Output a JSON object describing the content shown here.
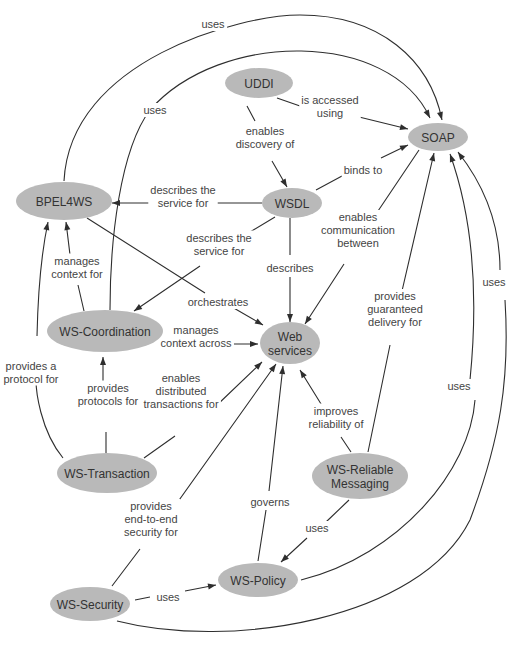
{
  "diagram": {
    "type": "concept-map",
    "style": {
      "node_fill": "#b9b9b9",
      "node_text": "#333333",
      "edge_color": "#2e2e2e",
      "label_color": "#444444",
      "background": "#ffffff"
    },
    "nodes": [
      {
        "id": "uddi",
        "label": [
          "UDDI"
        ],
        "cx": 259,
        "cy": 83,
        "rx": 34,
        "ry": 15
      },
      {
        "id": "soap",
        "label": [
          "SOAP"
        ],
        "cx": 438,
        "cy": 137,
        "rx": 30,
        "ry": 14
      },
      {
        "id": "wsdl",
        "label": [
          "WSDL"
        ],
        "cx": 292,
        "cy": 203,
        "rx": 30,
        "ry": 15
      },
      {
        "id": "bpel4ws",
        "label": [
          "BPEL4WS"
        ],
        "cx": 64,
        "cy": 201,
        "rx": 48,
        "ry": 19
      },
      {
        "id": "ws-coordination",
        "label": [
          "WS-Coordination"
        ],
        "cx": 105,
        "cy": 331,
        "rx": 58,
        "ry": 21
      },
      {
        "id": "web-services",
        "label": [
          "Web",
          "services"
        ],
        "cx": 290,
        "cy": 343,
        "rx": 30,
        "ry": 21
      },
      {
        "id": "ws-transaction",
        "label": [
          "WS-Transaction"
        ],
        "cx": 107,
        "cy": 473,
        "rx": 50,
        "ry": 20
      },
      {
        "id": "ws-reliable-messaging",
        "label": [
          "WS-Reliable",
          "Messaging"
        ],
        "cx": 360,
        "cy": 476,
        "rx": 48,
        "ry": 23
      },
      {
        "id": "ws-policy",
        "label": [
          "WS-Policy"
        ],
        "cx": 258,
        "cy": 580,
        "rx": 40,
        "ry": 17
      },
      {
        "id": "ws-security",
        "label": [
          "WS-Security"
        ],
        "cx": 90,
        "cy": 604,
        "rx": 40,
        "ry": 17
      }
    ],
    "edges": [
      {
        "from": "uddi",
        "to": "soap",
        "label": [
          "is accessed",
          "using"
        ],
        "path": "M 277 98 L 300 106 M 355 116 L 408 129",
        "arrow_at": [
          408,
          129
        ],
        "lx": 330,
        "ly": 106
      },
      {
        "from": "uddi",
        "to": "wsdl",
        "label": [
          "enables",
          "discovery of"
        ],
        "path": "M 247 106 L 255 121 M 272 161 L 287 187",
        "arrow_at": [
          287,
          187
        ],
        "lx": 265,
        "ly": 137
      },
      {
        "from": "wsdl",
        "to": "soap",
        "label": [
          "binds to"
        ],
        "path": "M 316 190 L 342 176 M 381 158 L 408 145",
        "arrow_at": [
          408,
          145
        ],
        "lx": 363,
        "ly": 170
      },
      {
        "from": "wsdl",
        "to": "bpel4ws",
        "label": [
          "describes the",
          "service for"
        ],
        "path": "M 262 203 L 212 203 M 152 203 L 112 203",
        "arrow_at": [
          112,
          203
        ],
        "lx": 183,
        "ly": 196
      },
      {
        "from": "wsdl",
        "to": "ws-coordination",
        "label": [
          "describes the",
          "service for"
        ],
        "path": "M 275 217 L 250 232 M 200 266 L 134 311",
        "arrow_at": [
          134,
          311
        ],
        "lx": 219,
        "ly": 244
      },
      {
        "from": "wsdl",
        "to": "web-services",
        "label": [
          "describes"
        ],
        "path": "M 290 218 L 290 255 M 290 277 L 290 322",
        "arrow_at": [
          290,
          322
        ],
        "lx": 290,
        "ly": 268
      },
      {
        "from": "soap",
        "to": "web-services",
        "label": [
          "enables",
          "communication",
          "between"
        ],
        "path": "M 419 150 L 376 214 M 344 264 L 305 324",
        "arrow_at": [
          305,
          324
        ],
        "lx": 358,
        "ly": 230
      },
      {
        "from": "bpel4ws",
        "to": "web-services",
        "label": [
          "orchestrates"
        ],
        "path": "M 87 218 L 205 293 M 232 307 L 263 325",
        "arrow_at": [
          263,
          325
        ],
        "lx": 218,
        "ly": 302
      },
      {
        "from": "ws-coordination",
        "to": "bpel4ws",
        "label": [
          "manages",
          "context for"
        ],
        "path": "M 84 311 L 78 285 M 71 263 L 66 222",
        "arrow_at": [
          66,
          222
        ],
        "lx": 77,
        "ly": 267
      },
      {
        "from": "ws-coordination",
        "to": "soap",
        "label": [
          "uses"
        ],
        "path": "M 110 310 C 110 240 120 150 150 110 C 220 30 390 30 430 118",
        "arrow_at": [
          430,
          118
        ],
        "lx": 155,
        "ly": 110
      },
      {
        "from": "bpel4ws",
        "to": "soap",
        "label": [
          "uses"
        ],
        "path": "M 64 181 C 70 60 240 15 300 15 C 380 15 430 60 442 120",
        "arrow_at": [
          442,
          120
        ],
        "lx": 213,
        "ly": 24
      },
      {
        "from": "ws-coordination",
        "to": "web-services",
        "label": [
          "manages",
          "context across"
        ],
        "path": "M 165 334 L 175 334 M 232 344 L 258 344",
        "arrow_at": [
          258,
          344
        ],
        "lx": 196,
        "ly": 336
      },
      {
        "from": "ws-transaction",
        "to": "ws-coordination",
        "label": [
          "provides",
          "protocols for"
        ],
        "path": "M 106 453 L 106 432 M 103 395 L 103 357",
        "arrow_at": [
          103,
          357
        ],
        "lx": 108,
        "ly": 394
      },
      {
        "from": "ws-transaction",
        "to": "bpel4ws",
        "label": [
          "provides a",
          "protocol for"
        ],
        "path": "M 63 458 C 40 430 36 390 36 380 M 37 336 C 38 290 42 250 48 222",
        "arrow_at": [
          48,
          222
        ],
        "lx": 31,
        "ly": 372
      },
      {
        "from": "ws-transaction",
        "to": "web-services",
        "label": [
          "enables",
          "distributed",
          "transactions for"
        ],
        "path": "M 144 458 L 175 436 M 216 406 L 262 362",
        "arrow_at": [
          262,
          362
        ],
        "lx": 181,
        "ly": 391
      },
      {
        "from": "ws-security",
        "to": "web-services",
        "label": [
          "provides",
          "end-to-end",
          "security for"
        ],
        "path": "M 112 586 L 140 549 M 172 510 L 276 364",
        "arrow_at": [
          276,
          364
        ],
        "lx": 151,
        "ly": 519
      },
      {
        "from": "ws-policy",
        "to": "web-services",
        "label": [
          "governs"
        ],
        "path": "M 258 561 L 266 510 M 269 491 L 283 366",
        "arrow_at": [
          283,
          366
        ],
        "lx": 270,
        "ly": 502
      },
      {
        "from": "ws-reliable-messaging",
        "to": "web-services",
        "label": [
          "improves",
          "reliability of"
        ],
        "path": "M 351 452 L 341 437 M 326 412 L 300 370",
        "arrow_at": [
          300,
          370
        ],
        "lx": 336,
        "ly": 417
      },
      {
        "from": "ws-reliable-messaging",
        "to": "soap",
        "label": [
          "provides",
          "guaranteed",
          "delivery for"
        ],
        "path": "M 368 452 L 390 345 M 402 291 L 434 153",
        "arrow_at": [
          434,
          153
        ],
        "lx": 395,
        "ly": 309
      },
      {
        "from": "ws-reliable-messaging",
        "to": "ws-policy",
        "label": [
          "uses"
        ],
        "path": "M 349 500 L 326 522 M 307 538 L 281 562",
        "arrow_at": [
          281,
          562
        ],
        "lx": 317,
        "ly": 528
      },
      {
        "from": "ws-security",
        "to": "ws-policy",
        "label": [
          "uses"
        ],
        "path": "M 135 600 L 150 597 M 185 591 L 216 585",
        "arrow_at": [
          216,
          585
        ],
        "lx": 168,
        "ly": 597
      },
      {
        "from": "ws-policy",
        "to": "soap",
        "label": [
          "uses"
        ],
        "path": "M 301 580 C 400 555 470 470 475 400 M 470 380 C 480 280 470 210 450 154",
        "arrow_at": [
          450,
          154
        ],
        "lx": 459,
        "ly": 386
      },
      {
        "from": "ws-security",
        "to": "soap",
        "label": [
          "uses"
        ],
        "path": "M 117 621 C 230 650 420 620 470 520 C 500 440 510 380 505 300 M 500 270 C 500 220 480 180 458 152",
        "arrow_at": [
          458,
          152
        ],
        "lx": 494,
        "ly": 282
      }
    ],
    "arrowheads": [
      {
        "x": 408,
        "y": 129,
        "angle": 14
      },
      {
        "x": 287,
        "y": 187,
        "angle": 60
      },
      {
        "x": 408,
        "y": 145,
        "angle": -25
      },
      {
        "x": 112,
        "y": 203,
        "angle": 180
      },
      {
        "x": 134,
        "y": 311,
        "angle": 146
      },
      {
        "x": 290,
        "y": 322,
        "angle": 90
      },
      {
        "x": 305,
        "y": 324,
        "angle": 123
      },
      {
        "x": 263,
        "y": 325,
        "angle": 30
      },
      {
        "x": 66,
        "y": 222,
        "angle": -100
      },
      {
        "x": 430,
        "y": 118,
        "angle": 62
      },
      {
        "x": 442,
        "y": 120,
        "angle": 75
      },
      {
        "x": 258,
        "y": 344,
        "angle": 0
      },
      {
        "x": 103,
        "y": 357,
        "angle": -90
      },
      {
        "x": 48,
        "y": 222,
        "angle": -78
      },
      {
        "x": 262,
        "y": 362,
        "angle": -44
      },
      {
        "x": 276,
        "y": 364,
        "angle": -55
      },
      {
        "x": 283,
        "y": 366,
        "angle": -84
      },
      {
        "x": 300,
        "y": 370,
        "angle": -122
      },
      {
        "x": 434,
        "y": 153,
        "angle": -77
      },
      {
        "x": 281,
        "y": 562,
        "angle": 137
      },
      {
        "x": 216,
        "y": 585,
        "angle": -11
      },
      {
        "x": 450,
        "y": 154,
        "angle": -110
      },
      {
        "x": 458,
        "y": 152,
        "angle": -125
      }
    ]
  }
}
